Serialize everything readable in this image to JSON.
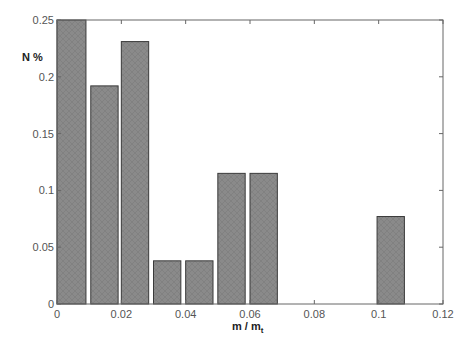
{
  "chart_data": {
    "type": "bar",
    "title": "",
    "xlabel": "m / m_t",
    "xlabel_main": "m / m",
    "xlabel_sub": "t",
    "ylabel": "N %",
    "xlim": [
      0,
      0.12
    ],
    "ylim": [
      0,
      0.25
    ],
    "xticks": [
      0,
      0.02,
      0.04,
      0.06,
      0.08,
      0.1,
      0.12
    ],
    "xtick_labels": [
      "0",
      "0.02",
      "0.04",
      "0.06",
      "0.08",
      "0.1",
      "0.12"
    ],
    "yticks": [
      0,
      0.05,
      0.1,
      0.15,
      0.2,
      0.25
    ],
    "ytick_labels": [
      "0",
      "0.05",
      "0.1",
      "0.15",
      "0.2",
      "0.25"
    ],
    "grid": false,
    "legend": null,
    "bin_width": 0.01,
    "bars": [
      {
        "x_start": 0.0,
        "x_end": 0.009,
        "value": 0.25
      },
      {
        "x_start": 0.0105,
        "x_end": 0.019,
        "value": 0.192
      },
      {
        "x_start": 0.02,
        "x_end": 0.0285,
        "value": 0.231
      },
      {
        "x_start": 0.03,
        "x_end": 0.0385,
        "value": 0.038
      },
      {
        "x_start": 0.04,
        "x_end": 0.0485,
        "value": 0.038
      },
      {
        "x_start": 0.05,
        "x_end": 0.0585,
        "value": 0.115
      },
      {
        "x_start": 0.06,
        "x_end": 0.0685,
        "value": 0.115
      },
      {
        "x_start": 0.0995,
        "x_end": 0.108,
        "value": 0.077
      }
    ],
    "categories": [
      "0.005",
      "0.015",
      "0.025",
      "0.035",
      "0.045",
      "0.055",
      "0.065",
      "0.105"
    ],
    "values": [
      0.25,
      0.192,
      0.231,
      0.038,
      0.038,
      0.115,
      0.115,
      0.077
    ],
    "colors": {
      "bar_fill": "#8a8a8a",
      "bar_edge": "#3a3a3a",
      "axis": "#666666",
      "background": "#ffffff"
    }
  }
}
